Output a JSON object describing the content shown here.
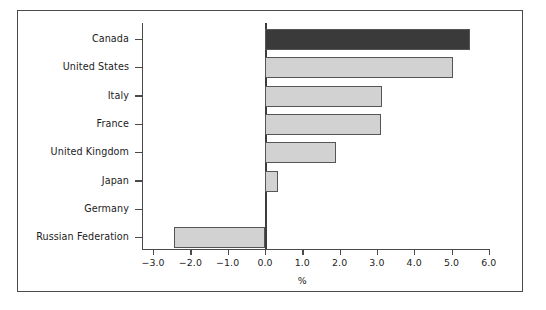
{
  "chart_data": {
    "type": "bar",
    "orientation": "horizontal",
    "title": "",
    "xlabel": "%",
    "ylabel": "",
    "xlim": [
      -3.0,
      6.0
    ],
    "xticks": [
      "-3.0",
      "-2.0",
      "-1.0",
      "0.0",
      "1.0",
      "2.0",
      "3.0",
      "4.0",
      "5.0",
      "6.0"
    ],
    "xtick_values": [
      -3.0,
      -2.0,
      -1.0,
      0.0,
      1.0,
      2.0,
      3.0,
      4.0,
      5.0,
      6.0
    ],
    "grid": false,
    "legend": false,
    "categories": [
      "Canada",
      "United States",
      "Italy",
      "France",
      "United Kingdom",
      "Japan",
      "Germany",
      "Russian Federation"
    ],
    "values": [
      5.5,
      5.05,
      3.15,
      3.1,
      1.9,
      0.35,
      0.0,
      -2.45
    ],
    "bar_colors": [
      "#3a3a3a",
      "#d2d2d2",
      "#d2d2d2",
      "#d2d2d2",
      "#d2d2d2",
      "#d2d2d2",
      "#d2d2d2",
      "#d2d2d2"
    ],
    "bar_edge_color": "#555555",
    "highlight_category": "Canada"
  },
  "figure": {
    "frame_color": "#4a4a4a",
    "background": "#ffffff",
    "axis_color": "#4a4a4a",
    "zero_line_color": "#3c3c3c"
  },
  "caption": {
    "text": ""
  }
}
